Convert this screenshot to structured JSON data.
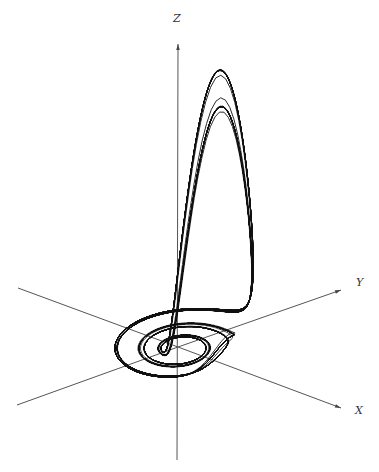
{
  "figure": {
    "title": "",
    "ink_color": "#111111",
    "axis_color": "#555555"
  },
  "axes": {
    "z": {
      "label": "Z",
      "x1": 177,
      "y1": 460,
      "x2": 178,
      "y2": 44,
      "label_x": 173,
      "label_y": 12
    },
    "y": {
      "label": "Y",
      "x1": 18,
      "y1": 288,
      "x2": 341,
      "y2": 290,
      "label_x": 356,
      "label_y": 276
    },
    "x": {
      "label": "X",
      "x1": 17,
      "y1": 405,
      "x2": 341,
      "y2": 408,
      "label_x": 355,
      "label_y": 404
    }
  },
  "attractor": {
    "center_x": 178,
    "center_y": 347,
    "disk_x_range": [
      88,
      242
    ],
    "disk_y_range": [
      318,
      392
    ],
    "lobe_peak_x": 197,
    "lobe_peak_y": 131
  }
}
